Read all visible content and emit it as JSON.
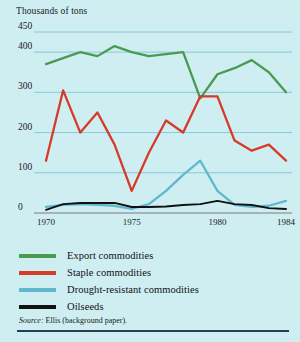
{
  "figure": {
    "background_color": "#cfeef2",
    "axis_title": "Thousands of tons",
    "source_note_prefix": "Source:",
    "source_note_text": " Ellis (background paper)."
  },
  "legend": {
    "position": "below-plot",
    "items": [
      {
        "label": "Export commodities",
        "color": "#4a9a52"
      },
      {
        "label": "Staple commodities",
        "color": "#d63a28"
      },
      {
        "label": "Drought-resistant commodities",
        "color": "#5fb8cc"
      },
      {
        "label": "Oilseeds",
        "color": "#111111"
      }
    ]
  },
  "chart_data": {
    "type": "line",
    "title": "",
    "subtitle": "",
    "xlabel": "",
    "ylabel": "Thousands of tons",
    "grid": true,
    "xlim": [
      1970,
      1984
    ],
    "ylim": [
      0,
      450
    ],
    "yticks": [
      0,
      100,
      200,
      300,
      400,
      450
    ],
    "ytick_labels": [
      "0",
      "100",
      "200",
      "300",
      "400",
      "450"
    ],
    "xticks": [
      1970,
      1975,
      1980,
      1984
    ],
    "xtick_labels": [
      "1970",
      "1975",
      "1980",
      "1984"
    ],
    "x": [
      1970,
      1971,
      1972,
      1973,
      1974,
      1975,
      1976,
      1977,
      1978,
      1979,
      1980,
      1981,
      1982,
      1983,
      1984
    ],
    "series": [
      {
        "name": "Export commodities",
        "color": "#4a9a52",
        "values": [
          370,
          385,
          400,
          390,
          415,
          400,
          390,
          395,
          400,
          285,
          345,
          360,
          380,
          350,
          300
        ]
      },
      {
        "name": "Staple commodities",
        "color": "#d63a28",
        "values": [
          130,
          305,
          200,
          250,
          170,
          55,
          150,
          230,
          200,
          290,
          290,
          180,
          155,
          170,
          130
        ]
      },
      {
        "name": "Drought-resistant commodities",
        "color": "#5fb8cc",
        "values": [
          15,
          20,
          22,
          20,
          18,
          10,
          22,
          55,
          95,
          130,
          55,
          20,
          15,
          18,
          30
        ]
      },
      {
        "name": "Oilseeds",
        "color": "#111111",
        "values": [
          8,
          22,
          25,
          25,
          25,
          15,
          15,
          16,
          20,
          22,
          30,
          22,
          20,
          12,
          10
        ]
      }
    ]
  }
}
